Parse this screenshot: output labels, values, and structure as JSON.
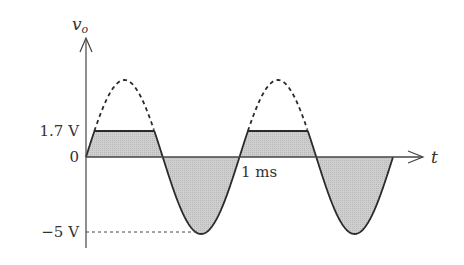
{
  "diagram": {
    "y_axis_label": "v",
    "y_axis_subscript": "o",
    "x_axis_label": "t",
    "level_labels": {
      "clip": "1.7 V",
      "zero": "0",
      "negative_peak": "−5 V"
    },
    "time_label": "1 ms",
    "colors": {
      "line": "#2b2b2b",
      "fill": "#c8c8c8",
      "axis": "#444444"
    }
  },
  "chart_data": {
    "type": "line",
    "title": "",
    "xlabel": "t",
    "ylabel": "v_o",
    "series": [
      {
        "name": "v_o (clipped output)",
        "description": "Sinusoid clipped at +1.7 V, negative peak -5 V, period 1 ms",
        "clip_level_V": 1.7,
        "negative_peak_V": -5,
        "period_ms": 1,
        "cycles_shown": 2
      },
      {
        "name": "unclipped sinusoid (dashed)",
        "style": "dashed",
        "peak_V": 5
      }
    ],
    "annotations": [
      "1.7 V",
      "0",
      "−5 V",
      "1 ms"
    ]
  }
}
